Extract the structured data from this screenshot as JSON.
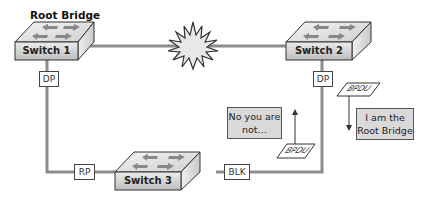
{
  "diagram": {
    "title_label": "Root Bridge",
    "switches": [
      {
        "id": "switch1",
        "label": "Switch 1",
        "role": "Root Bridge"
      },
      {
        "id": "switch2",
        "label": "Switch 2"
      },
      {
        "id": "switch3",
        "label": "Switch 3"
      }
    ],
    "ports": {
      "switch1_down": "DP",
      "switch2_down": "DP",
      "switch3_left": "RP",
      "switch3_right": "BLK"
    },
    "bpdus": [
      {
        "label": "BPDU",
        "direction": "down"
      },
      {
        "label": "BPDU",
        "direction": "up"
      }
    ],
    "notes": {
      "switch2_claim": "I am the Root Bridge",
      "switch2_claim_line1": "I am the",
      "switch2_claim_line2": "Root Bridge",
      "reply_line1": "No you are",
      "reply_line2": "not…"
    },
    "link_failure_icon": "starburst-icon",
    "colors": {
      "link": "#8c8c8c",
      "switch_front": "#d0d0d0",
      "switch_top": "#e6e6e6",
      "note_bg": "#d9d9d9"
    }
  }
}
